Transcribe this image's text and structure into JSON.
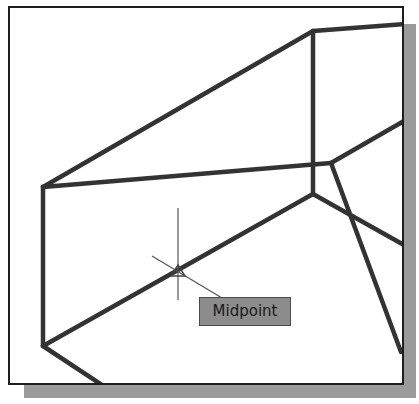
{
  "drawing": {
    "type": "CAD viewport wireframe",
    "stroke_color": "#333333",
    "background": "#ffffff",
    "shadow_color": "#9a9a9a"
  },
  "snap": {
    "mode": "Midpoint",
    "marker": "triangle",
    "tooltip_label": "Midpoint",
    "tooltip_bg": "#8c8c8c"
  },
  "cursor": {
    "type": "crosshair",
    "x": 178,
    "y": 270
  }
}
